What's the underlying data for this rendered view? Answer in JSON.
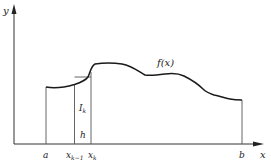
{
  "diagram": {
    "type": "riemann-strip-illustration",
    "axes": {
      "x_label": "x",
      "y_label": "y"
    },
    "curve_label": "f(x)",
    "strip": {
      "height_label_main": "I",
      "height_label_sub": "k",
      "width_label": "h"
    },
    "ticks": {
      "a": "a",
      "x_km1_main": "x",
      "x_km1_sub": "k−1",
      "x_k_main": "x",
      "x_k_sub": "k",
      "b": "b"
    },
    "colors": {
      "curve": "#1a1a1a",
      "axis": "#333333",
      "guide": "#555555",
      "background": "#ffffff"
    }
  }
}
